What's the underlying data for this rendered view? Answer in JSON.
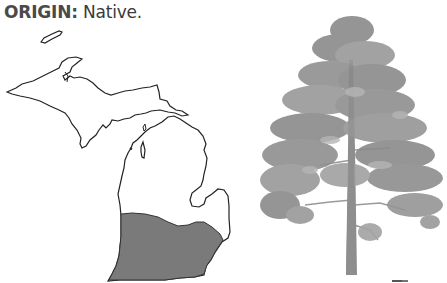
{
  "header": {
    "label": "ORIGIN:",
    "value": " Native."
  },
  "map": {
    "region": "Michigan",
    "range_fill_color": "#7a7a7a",
    "outline_color": "#222222",
    "range_description": "Southern Lower Peninsula"
  },
  "illustration": {
    "subject": "tree",
    "foliage_color": "#8c8c8c",
    "trunk_color": "#8a8a8a"
  }
}
